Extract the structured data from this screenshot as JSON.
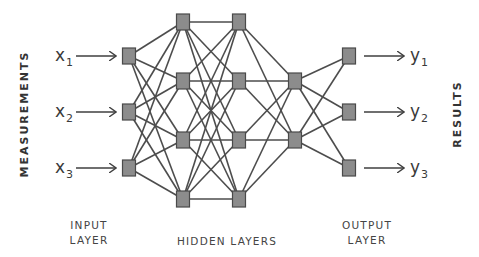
{
  "diagram": {
    "type": "neural-network",
    "side_labels": {
      "left": "MEASUREMENTS",
      "right": "RESULTS"
    },
    "inputs": [
      {
        "var": "x",
        "sub": "1"
      },
      {
        "var": "x",
        "sub": "2"
      },
      {
        "var": "x",
        "sub": "3"
      }
    ],
    "outputs": [
      {
        "var": "y",
        "sub": "1"
      },
      {
        "var": "y",
        "sub": "2"
      },
      {
        "var": "y",
        "sub": "3"
      }
    ],
    "layer_labels": {
      "input_line1": "INPUT",
      "input_line2": "LAYER",
      "hidden": "HIDDEN LAYERS",
      "output_line1": "OUTPUT",
      "output_line2": "LAYER"
    },
    "layers": [
      {
        "name": "input",
        "x": 129,
        "nodes_y": [
          56,
          112,
          168
        ]
      },
      {
        "name": "hidden-1",
        "x": 183,
        "nodes_y": [
          22,
          81,
          140,
          199
        ]
      },
      {
        "name": "hidden-2",
        "x": 239,
        "nodes_y": [
          22,
          81,
          140,
          199
        ]
      },
      {
        "name": "hidden-3",
        "x": 295,
        "nodes_y": [
          81,
          140
        ]
      },
      {
        "name": "output",
        "x": 349,
        "nodes_y": [
          56,
          112,
          168
        ]
      }
    ],
    "connectivity": "fully-connected",
    "colors": {
      "node_fill": "#8c8c8c",
      "node_border": "#4a4a4a",
      "edge": "#4d4d4d",
      "text": "#333333"
    }
  }
}
